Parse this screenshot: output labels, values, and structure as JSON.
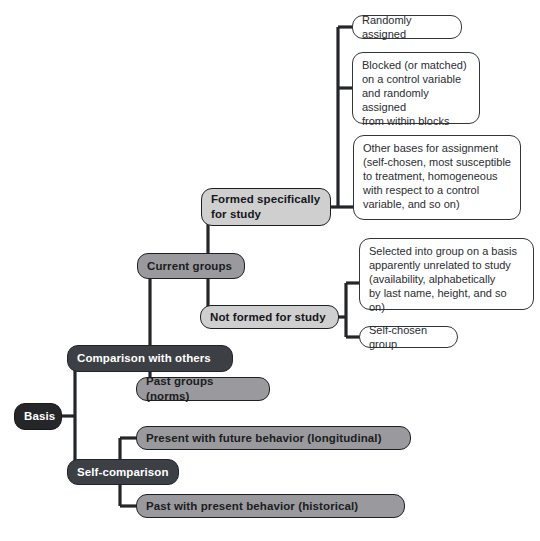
{
  "diagram": {
    "type": "tree-diagram",
    "orientation": "left-to-right",
    "background_color": "#ffffff",
    "palette": {
      "root_fill": "#24262a",
      "root_text": "#ffffff",
      "level2_fill": "#3c3f44",
      "level2_text": "#ffffff",
      "level3_fill": "#9a9a9e",
      "level3_text": "#1b1d20",
      "leaf_gray_fill": "#cfcfcf",
      "leaf_gray_text": "#14161a",
      "leaf_white_fill": "#ffffff",
      "leaf_white_text": "#2a2d31",
      "connector_color": "#24262a"
    },
    "nodes": {
      "root": "Basis",
      "comparison_with_others": "Comparison with others",
      "self_comparison": "Self-comparison",
      "current_groups": "Current groups",
      "past_groups_norms": "Past groups (norms)",
      "formed_specifically_for_study": "Formed specifically\nfor study",
      "not_formed_for_study": "Not formed for study",
      "randomly_assigned": "Randomly assigned",
      "blocked_or_matched": "Blocked (or matched)\non a control variable\nand randomly assigned\nfrom within blocks",
      "other_bases_for_assignment": "Other bases for assignment\n(self-chosen, most susceptible\nto treatment, homogeneous\nwith respect to a control\nvariable, and so on)",
      "selected_into_group": "Selected into group on a basis\napparently unrelated to study\n(availability, alphabetically\nby last name, height, and so on)",
      "self_chosen_group": "Self-chosen group",
      "present_with_future_behavior": "Present with future behavior (longitudinal)",
      "past_with_present_behavior": "Past with present behavior (historical)"
    },
    "edges": [
      {
        "from": "root",
        "to": "comparison_with_others"
      },
      {
        "from": "root",
        "to": "self_comparison"
      },
      {
        "from": "comparison_with_others",
        "to": "current_groups"
      },
      {
        "from": "comparison_with_others",
        "to": "past_groups_norms"
      },
      {
        "from": "current_groups",
        "to": "formed_specifically_for_study"
      },
      {
        "from": "current_groups",
        "to": "not_formed_for_study"
      },
      {
        "from": "formed_specifically_for_study",
        "to": "randomly_assigned"
      },
      {
        "from": "formed_specifically_for_study",
        "to": "blocked_or_matched"
      },
      {
        "from": "formed_specifically_for_study",
        "to": "other_bases_for_assignment"
      },
      {
        "from": "not_formed_for_study",
        "to": "selected_into_group"
      },
      {
        "from": "not_formed_for_study",
        "to": "self_chosen_group"
      },
      {
        "from": "self_comparison",
        "to": "present_with_future_behavior"
      },
      {
        "from": "self_comparison",
        "to": "past_with_present_behavior"
      }
    ]
  }
}
